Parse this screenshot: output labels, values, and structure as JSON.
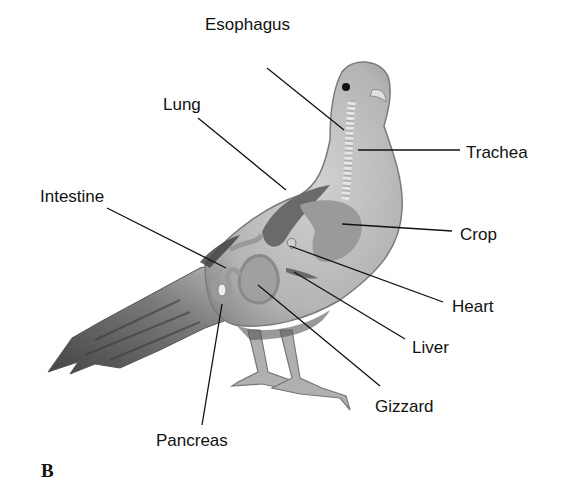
{
  "figure": {
    "panel_label": "B",
    "labels": {
      "esophagus": "Esophagus",
      "lung": "Lung",
      "trachea": "Trachea",
      "intestine": "Intestine",
      "crop": "Crop",
      "heart": "Heart",
      "liver": "Liver",
      "gizzard": "Gizzard",
      "pancreas": "Pancreas"
    }
  },
  "colors": {
    "ink": "#111111",
    "body_light": "#c9c9c9",
    "body_mid": "#a8a8a8",
    "body_dark": "#6e6e6e",
    "organ": "#9a9a9a",
    "organ_dark": "#6a6a6a"
  }
}
